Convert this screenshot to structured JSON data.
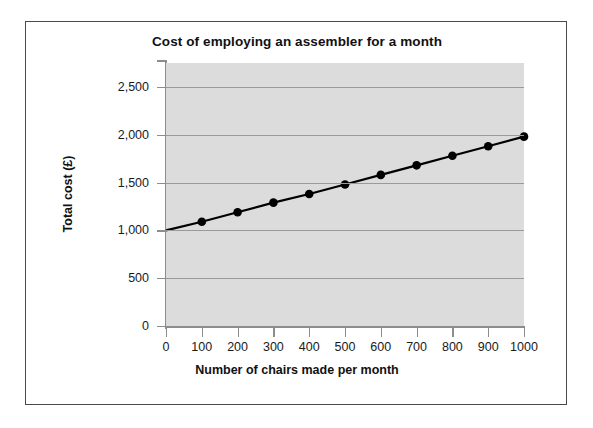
{
  "chart_data": {
    "type": "line",
    "title": "Cost of employing an assembler for a month",
    "xlabel": "Number of chairs made per month",
    "ylabel": "Total cost (£)",
    "xlim": [
      0,
      1000
    ],
    "ylim": [
      0,
      2750
    ],
    "xticks": [
      0,
      100,
      200,
      300,
      400,
      500,
      600,
      700,
      800,
      900,
      1000
    ],
    "xtick_labels": [
      "0",
      "100",
      "200",
      "300",
      "400",
      "500",
      "600",
      "700",
      "800",
      "900",
      "1000"
    ],
    "yticks": [
      0,
      500,
      1000,
      1500,
      2000,
      2500
    ],
    "ytick_labels": [
      "0",
      "500",
      "1,000",
      "1,500",
      "2,000",
      "2,500"
    ],
    "grid": "horizontal",
    "legend": "none",
    "plot_background": "#dcdcdc",
    "line_color": "#000000",
    "marker": "filled-circle",
    "marker_color": "#000000",
    "series": [
      {
        "name": "Total cost",
        "x": [
          0,
          100,
          200,
          300,
          400,
          500,
          600,
          700,
          800,
          900,
          1000
        ],
        "values": [
          1000,
          1090,
          1190,
          1290,
          1380,
          1480,
          1580,
          1680,
          1780,
          1880,
          1980
        ],
        "markers_shown_from_x": 100
      }
    ],
    "annotations": []
  },
  "chart": {
    "title": "Cost of employing an assembler for a month",
    "xlabel": "Number of chairs made per month",
    "ylabel": "Total cost (£)"
  }
}
